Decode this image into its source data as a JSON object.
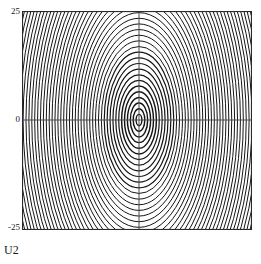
{
  "figure": {
    "caption": "U2",
    "background_color": "#ffffff",
    "contour_color": "#141414",
    "axis_color": "#4a4a4a",
    "frame_color": "#2a2a2a"
  },
  "axis": {
    "y_ticks": [
      {
        "label": "25",
        "value": 25
      },
      {
        "label": "0",
        "value": 0
      },
      {
        "label": "-25",
        "value": -25
      }
    ],
    "y_range": [
      -25,
      25
    ],
    "x_label": "U2"
  },
  "chart_data": {
    "type": "contour",
    "title": "",
    "xlabel": "U2",
    "ylabel": "",
    "ylim": [
      -25,
      25
    ],
    "xlim": [
      -26,
      26
    ],
    "grid": false,
    "legend": "none",
    "center": {
      "x": 0,
      "y": 0
    },
    "aspect_ratio_y_over_x": 1.95,
    "crosshair": {
      "horizontal_at_y": 0,
      "vertical_at_x": 0
    },
    "contour_levels": [
      1,
      4,
      9,
      16,
      25,
      36,
      49,
      64,
      81,
      100,
      121,
      144,
      169,
      196,
      225,
      256,
      289,
      324,
      361,
      400,
      441,
      484,
      529,
      576,
      625,
      676,
      729,
      784,
      841,
      900,
      961,
      1024,
      1089,
      1156,
      1225,
      1296,
      1369,
      1444,
      1521,
      1600,
      1681,
      1764,
      1849,
      1936,
      2025,
      2116,
      2209,
      2304,
      2401,
      2500
    ],
    "level_count": 50,
    "semi_axis_x_units": [
      1.15,
      2.3,
      3.45,
      4.6,
      5.75,
      6.9,
      8.05,
      9.2,
      10.35,
      11.5,
      12.65,
      13.8,
      14.95,
      16.1,
      17.25,
      18.4,
      19.55,
      20.7,
      21.85,
      23.0,
      24.15,
      25.3,
      26.45,
      27.6,
      28.75,
      29.9,
      31.05,
      32.2,
      33.35,
      34.5,
      35.65,
      36.8,
      37.95,
      39.1,
      40.25,
      41.4,
      42.55,
      43.7,
      44.85,
      46.0,
      47.15,
      48.3,
      49.45,
      50.6,
      51.75,
      52.9,
      54.05,
      55.2,
      56.35,
      57.5
    ]
  }
}
